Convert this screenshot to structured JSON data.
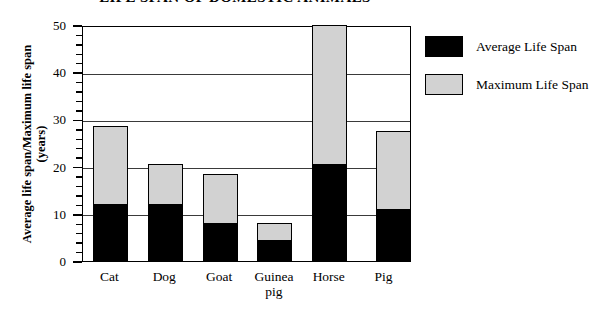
{
  "chart_data": {
    "type": "bar",
    "title": "LIFE SPAN OF DOMESTIC ANIMALS",
    "xlabel": "",
    "ylabel": "Average life span/Maximum life span",
    "ylabel_unit": "(years)",
    "ylim": [
      0,
      50
    ],
    "ytick_step": 10,
    "yminor_step": 2,
    "grid": true,
    "stacked": true,
    "legend_position": "right",
    "categories": [
      "Cat",
      "Dog",
      "Goat",
      "Guinea pig",
      "Horse",
      "Pig"
    ],
    "category_lines": [
      [
        "Cat"
      ],
      [
        "Dog"
      ],
      [
        "Goat"
      ],
      [
        "Guinea",
        "pig"
      ],
      [
        "Horse"
      ],
      [
        "Pig"
      ]
    ],
    "ticks": [
      "0",
      "10",
      "20",
      "30",
      "40",
      "50"
    ],
    "series": [
      {
        "name": "Average Life Span",
        "color": "#000000",
        "values": [
          12,
          12,
          8,
          4.5,
          20.5,
          11
        ]
      },
      {
        "name": "Maximum Life Span",
        "color": "#d2d2d2",
        "values": [
          28.5,
          20.5,
          18.5,
          8,
          50,
          27.5
        ]
      }
    ]
  },
  "legend": {
    "items": [
      {
        "label": "Average Life Span",
        "color": "#000000"
      },
      {
        "label": "Maximum Life Span",
        "color": "#d2d2d2"
      }
    ]
  }
}
